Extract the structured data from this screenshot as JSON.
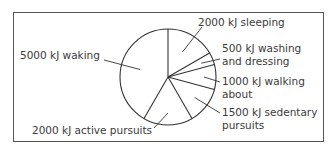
{
  "chart_data": {
    "type": "pie",
    "title": "",
    "unit": "kJ",
    "total": 12000,
    "start_angle_deg": 0,
    "direction": "clockwise",
    "categories": [
      "sleeping",
      "washing and dressing",
      "walking about",
      "sedentary pursuits",
      "active pursuits",
      "waking"
    ],
    "values": [
      2000,
      500,
      1000,
      1500,
      2000,
      5000
    ],
    "slices": [
      {
        "label": "2000 kJ sleeping",
        "value": 2000
      },
      {
        "label": "500 kJ washing and dressing",
        "value": 500
      },
      {
        "label": "1000 kJ walking about",
        "value": 1000
      },
      {
        "label": "1500 kJ sedentary pursuits",
        "value": 1500
      },
      {
        "label": "2000 kJ active pursuits",
        "value": 2000
      },
      {
        "label": "5000 kJ waking",
        "value": 5000
      }
    ],
    "legend": "none (leader-line labels)"
  },
  "labels": {
    "sleeping": "2000 kJ sleeping",
    "washing_1": "500 kJ washing",
    "washing_2": "and dressing",
    "walking_1": "1000 kJ walking",
    "walking_2": "about",
    "sedentary_1": "1500 kJ sedentary",
    "sedentary_2": "pursuits",
    "active": "2000 kJ active pursuits",
    "waking": "5000 kJ waking"
  },
  "colors": {
    "line": "#333333",
    "fill": "#ffffff",
    "frame": "#555555"
  }
}
